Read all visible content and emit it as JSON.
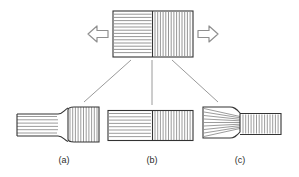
{
  "figure": {
    "title": "",
    "background": "#ffffff",
    "stroke_dark": "#333333",
    "stroke_hatch": "#8a8a8a",
    "stroke_leader": "#9a9a9a",
    "arrow_stroke": "#8f8f8f",
    "label_color": "#2b2b2b"
  },
  "top_specimen": {
    "name": "composite-block-under-tension",
    "x": 113,
    "y": 11,
    "width": 80,
    "height": 46,
    "split_x": 152,
    "left_hatch": "horizontal",
    "right_hatch": "vertical",
    "horizontal_line_count": 13,
    "vertical_line_count": 14
  },
  "arrows": {
    "left": {
      "name": "tension-arrow-left",
      "direction": "left",
      "cx": 99,
      "cy": 34
    },
    "right": {
      "name": "tension-arrow-right",
      "direction": "right",
      "cx": 207,
      "cy": 34
    }
  },
  "leaders": [
    {
      "name": "leader-line-a",
      "x1": 131,
      "y1": 60,
      "x2": 84,
      "y2": 102
    },
    {
      "name": "leader-line-b",
      "x1": 152,
      "y1": 60,
      "x2": 152,
      "y2": 105
    },
    {
      "name": "leader-line-c",
      "x1": 172,
      "y1": 60,
      "x2": 218,
      "y2": 102
    }
  ],
  "variants": [
    {
      "id": "a",
      "name": "variant-a",
      "label": "(a)",
      "label_x": 64,
      "label_y": 163,
      "description": "thin horizontally-hatched shank flaring into tall vertically-hatched block at right",
      "thin_side": "left",
      "thin_hatch": "horizontal",
      "block_hatch": "vertical"
    },
    {
      "id": "b",
      "name": "variant-b",
      "label": "(b)",
      "label_x": 152,
      "label_y": 163,
      "description": "uniform-height bar, horizontally hatched left half and vertically hatched right half",
      "thin_side": "none",
      "thin_hatch": "horizontal",
      "block_hatch": "vertical"
    },
    {
      "id": "c",
      "name": "variant-c",
      "label": "(c)",
      "label_x": 240,
      "label_y": 163,
      "description": "tall horizontally-hatched block necking down into thin vertically-hatched shank at right",
      "thin_side": "right",
      "thin_hatch": "vertical",
      "block_hatch": "horizontal"
    }
  ]
}
